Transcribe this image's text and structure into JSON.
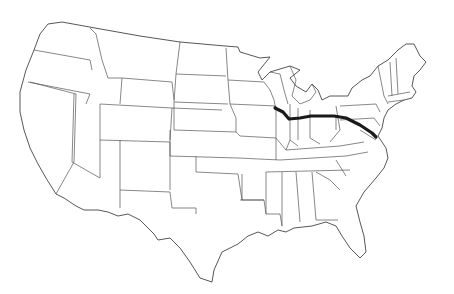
{
  "map": {
    "type": "outline",
    "region": "Contiguous United States",
    "background": "#ffffff",
    "border_color": "#555555",
    "route": {
      "color": "#1a1a1a",
      "description": "Route from western Illinois east across Indiana, Ohio, Pennsylvania to Maryland/DC",
      "points": "275,108 283,112 289,119 300,118 311,116 322,116 334,116 346,118 360,125 372,133 376,137"
    }
  }
}
